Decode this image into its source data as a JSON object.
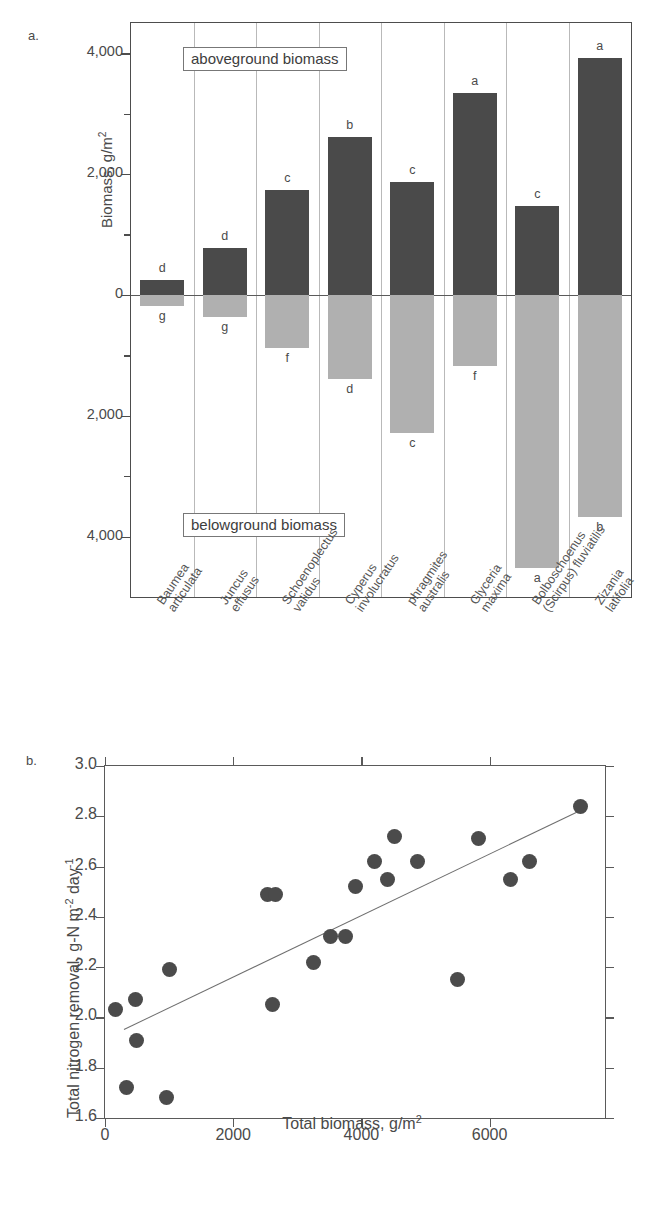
{
  "figure": {
    "panel_a_letter": "a.",
    "panel_b_letter": "b."
  },
  "chart_data": [
    {
      "type": "bar",
      "panel": "a",
      "title": "",
      "xlabel": "",
      "ylabel": "Biomass, g/m2",
      "ylabel_html": "Biomass, g/m²",
      "ylim": [
        -5000,
        4500
      ],
      "yticks_major": [
        4000,
        2000,
        0,
        -2000,
        -4000
      ],
      "ytick_labels": [
        "4,000",
        "2,000",
        "0",
        "2,000",
        "4,000"
      ],
      "yticks_minor": [
        3000,
        1000,
        -1000,
        -3000
      ],
      "grid": "vertical-separators",
      "annotations": [
        "aboveground biomass",
        "belowground biomass"
      ],
      "categories": [
        "Baumea articulata",
        "Juncus effusus",
        "Schoenoplectus validus",
        "Cyperus involucratus",
        "phragmites australis",
        "Glyceria maxima",
        "Bolboschoenus (Scirpus) fluviatilis",
        "Zizania latifolia"
      ],
      "category_lines": [
        [
          "Baumea",
          "articulata"
        ],
        [
          "Juncus",
          "effusus"
        ],
        [
          "Schoenoplectus",
          "validus"
        ],
        [
          "Cyperus",
          "involucratus"
        ],
        [
          "phragmites",
          "australis"
        ],
        [
          "Glyceria",
          "maxima"
        ],
        [
          "Bolboschoenus",
          "(Scirpus) fluviatilis"
        ],
        [
          "Zizania",
          "latifolia"
        ]
      ],
      "series": [
        {
          "name": "aboveground biomass",
          "color": "#4a4a4a",
          "values": [
            240,
            780,
            1730,
            2620,
            1870,
            3340,
            1470,
            3920
          ],
          "sig_letters": [
            "d",
            "d",
            "c",
            "b",
            "c",
            "a",
            "c",
            "a"
          ]
        },
        {
          "name": "belowground biomass",
          "color": "#b0b0b0",
          "values": [
            -190,
            -360,
            -880,
            -1400,
            -2280,
            -1170,
            -4520,
            -3670
          ],
          "sig_letters": [
            "g",
            "g",
            "f",
            "d",
            "c",
            "f",
            "a",
            "b"
          ]
        }
      ]
    },
    {
      "type": "scatter",
      "panel": "b",
      "title": "",
      "xlabel": "Total biomass, g/m2",
      "xlabel_html": "Total biomass, g/m²",
      "ylabel": "Total nitrogen removal, g-N m-2 day-1",
      "ylabel_html": "Total nitrogen removal, g-N m<sup>-2</sup> day<sup>-1</sup>",
      "xlim": [
        0,
        7800
      ],
      "ylim": [
        1.6,
        3.0
      ],
      "xticks": [
        0,
        2000,
        4000,
        6000
      ],
      "xtick_labels": [
        "0",
        "2000",
        "4000",
        "6000"
      ],
      "yticks": [
        1.6,
        1.8,
        2.0,
        2.2,
        2.4,
        2.6,
        2.8,
        3.0
      ],
      "ytick_labels": [
        "1.6",
        "1.8",
        "2.0",
        "2.2",
        "2.4",
        "2.6",
        "2.8",
        "3.0"
      ],
      "grid": false,
      "legend": "none",
      "marker_color": "#4b4b4b",
      "points": [
        {
          "x": 170,
          "y": 2.03
        },
        {
          "x": 330,
          "y": 1.72
        },
        {
          "x": 470,
          "y": 2.07
        },
        {
          "x": 490,
          "y": 1.91
        },
        {
          "x": 960,
          "y": 1.68
        },
        {
          "x": 1000,
          "y": 2.19
        },
        {
          "x": 2540,
          "y": 2.49
        },
        {
          "x": 2660,
          "y": 2.49
        },
        {
          "x": 2620,
          "y": 2.05
        },
        {
          "x": 3250,
          "y": 2.22
        },
        {
          "x": 3520,
          "y": 2.32
        },
        {
          "x": 3750,
          "y": 2.32
        },
        {
          "x": 3900,
          "y": 2.52
        },
        {
          "x": 4200,
          "y": 2.62
        },
        {
          "x": 4400,
          "y": 2.55
        },
        {
          "x": 4520,
          "y": 2.72
        },
        {
          "x": 4880,
          "y": 2.62
        },
        {
          "x": 5500,
          "y": 2.15
        },
        {
          "x": 5820,
          "y": 2.71
        },
        {
          "x": 6330,
          "y": 2.55
        },
        {
          "x": 6620,
          "y": 2.62
        },
        {
          "x": 7420,
          "y": 2.84
        }
      ],
      "trendline": {
        "x0": 300,
        "y0": 1.955,
        "x1": 7450,
        "y1": 2.83
      }
    }
  ]
}
